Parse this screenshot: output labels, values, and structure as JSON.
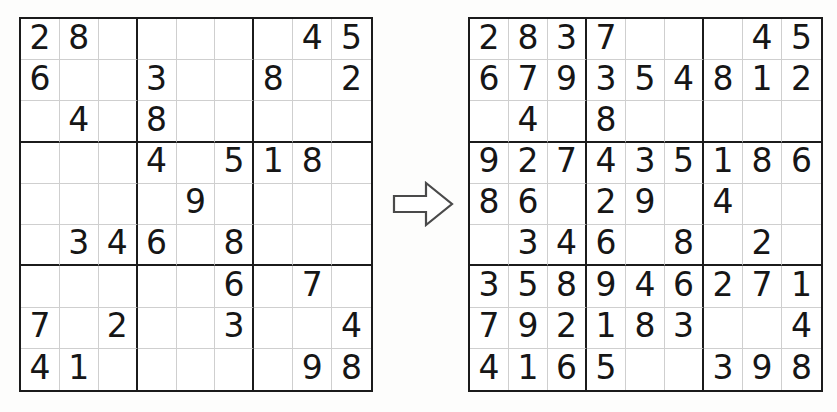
{
  "figure": {
    "title": "Sudoku puzzle transformed into its partially completed solution",
    "arrow_label": "right-arrow"
  },
  "colors": {
    "page_background": "#fdfdfc",
    "grid_background": "#ffffff",
    "thin_line": "#cfcfcf",
    "thick_line": "#1b1b1b",
    "digit": "#161616",
    "arrow_outline": "#4a4a4a",
    "arrow_fill": "#ffffff"
  },
  "grids": [
    {
      "id": "puzzle",
      "name": "sudoku-puzzle-grid",
      "caption": "Puzzle",
      "size": 9,
      "box_size": 3,
      "rows": [
        [
          "2",
          "8",
          "",
          "",
          "",
          "",
          "",
          "4",
          "5"
        ],
        [
          "6",
          "",
          "",
          "3",
          "",
          "",
          "8",
          "",
          "2"
        ],
        [
          "",
          "4",
          "",
          "8",
          "",
          "",
          "",
          "",
          ""
        ],
        [
          "",
          "",
          "",
          "4",
          "",
          "5",
          "1",
          "8",
          ""
        ],
        [
          "",
          "",
          "",
          "",
          "9",
          "",
          "",
          "",
          ""
        ],
        [
          "",
          "3",
          "4",
          "6",
          "",
          "8",
          "",
          "",
          ""
        ],
        [
          "",
          "",
          "",
          "",
          "",
          "6",
          "",
          "7",
          ""
        ],
        [
          "7",
          "",
          "2",
          "",
          "",
          "3",
          "",
          "",
          "4"
        ],
        [
          "4",
          "1",
          "",
          "",
          "",
          "",
          "",
          "9",
          "8"
        ]
      ],
      "given_count": 29
    },
    {
      "id": "solution",
      "name": "sudoku-solution-grid",
      "caption": "Partial solution",
      "size": 9,
      "box_size": 3,
      "rows": [
        [
          "2",
          "8",
          "3",
          "7",
          "",
          "",
          "",
          "4",
          "5"
        ],
        [
          "6",
          "7",
          "9",
          "3",
          "5",
          "4",
          "8",
          "1",
          "2"
        ],
        [
          "",
          "4",
          "",
          "8",
          "",
          "",
          "",
          "",
          ""
        ],
        [
          "9",
          "2",
          "7",
          "4",
          "3",
          "5",
          "1",
          "8",
          "6"
        ],
        [
          "8",
          "6",
          "",
          "2",
          "9",
          "",
          "4",
          "",
          ""
        ],
        [
          "",
          "3",
          "4",
          "6",
          "",
          "8",
          "",
          "2",
          ""
        ],
        [
          "3",
          "5",
          "8",
          "9",
          "4",
          "6",
          "2",
          "7",
          "1"
        ],
        [
          "7",
          "9",
          "2",
          "1",
          "8",
          "3",
          "",
          "",
          "4"
        ],
        [
          "4",
          "1",
          "6",
          "5",
          "",
          "",
          "3",
          "9",
          "8"
        ]
      ],
      "filled_count": 57
    }
  ]
}
